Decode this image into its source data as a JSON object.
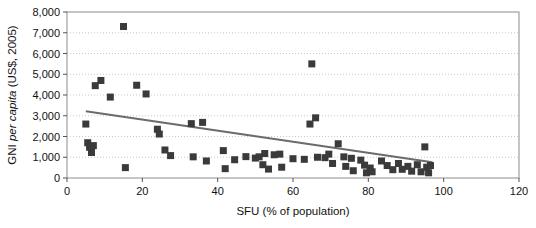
{
  "chart_data": {
    "type": "scatter",
    "title": "",
    "xlabel": "SFU (% of population)",
    "ylabel_prefix": "GNI ",
    "ylabel_italic": "per capita",
    "ylabel_suffix": " (US$, 2005)",
    "ylabel_full": "GNI per capita (US$, 2005)",
    "xlim": [
      0,
      120
    ],
    "ylim": [
      0,
      8000
    ],
    "xticks": [
      0,
      20,
      40,
      60,
      80,
      100,
      120
    ],
    "xtick_labels": [
      "0",
      "20",
      "40",
      "60",
      "80",
      "100",
      "120"
    ],
    "yticks": [
      0,
      1000,
      2000,
      3000,
      4000,
      5000,
      6000,
      7000,
      8000
    ],
    "ytick_labels": [
      "0",
      "1,000",
      "2,000",
      "3,000",
      "4,000",
      "5,000",
      "6,000",
      "7,000",
      "8,000"
    ],
    "grid": "horizontal-dotted",
    "legend": "none",
    "marker": {
      "shape": "square",
      "size": 7,
      "color": "#3a3a3a"
    },
    "trendline": {
      "color": "#6b6b6b",
      "width": 2,
      "x": [
        5,
        97
      ],
      "y": [
        3220,
        760
      ]
    },
    "points": [
      {
        "x": 5.0,
        "y": 2600
      },
      {
        "x": 5.5,
        "y": 1700
      },
      {
        "x": 6.0,
        "y": 1480
      },
      {
        "x": 6.5,
        "y": 1230
      },
      {
        "x": 7.0,
        "y": 1560
      },
      {
        "x": 7.5,
        "y": 4450
      },
      {
        "x": 9.0,
        "y": 4700
      },
      {
        "x": 11.5,
        "y": 3900
      },
      {
        "x": 15.0,
        "y": 7300
      },
      {
        "x": 15.5,
        "y": 500
      },
      {
        "x": 18.5,
        "y": 4470
      },
      {
        "x": 21.0,
        "y": 4050
      },
      {
        "x": 24.0,
        "y": 2350
      },
      {
        "x": 24.5,
        "y": 2120
      },
      {
        "x": 26.0,
        "y": 1350
      },
      {
        "x": 27.5,
        "y": 1080
      },
      {
        "x": 33.0,
        "y": 2620
      },
      {
        "x": 33.5,
        "y": 1020
      },
      {
        "x": 36.0,
        "y": 2680
      },
      {
        "x": 37.0,
        "y": 820
      },
      {
        "x": 41.5,
        "y": 1320
      },
      {
        "x": 42.0,
        "y": 450
      },
      {
        "x": 44.5,
        "y": 880
      },
      {
        "x": 47.5,
        "y": 1030
      },
      {
        "x": 50.0,
        "y": 960
      },
      {
        "x": 51.0,
        "y": 1020
      },
      {
        "x": 52.5,
        "y": 1180
      },
      {
        "x": 52.0,
        "y": 640
      },
      {
        "x": 53.5,
        "y": 430
      },
      {
        "x": 55.0,
        "y": 1120
      },
      {
        "x": 56.5,
        "y": 1150
      },
      {
        "x": 57.0,
        "y": 520
      },
      {
        "x": 60.0,
        "y": 930
      },
      {
        "x": 63.0,
        "y": 900
      },
      {
        "x": 64.5,
        "y": 2600
      },
      {
        "x": 65.0,
        "y": 5500
      },
      {
        "x": 66.0,
        "y": 2900
      },
      {
        "x": 66.5,
        "y": 1000
      },
      {
        "x": 68.5,
        "y": 980
      },
      {
        "x": 69.5,
        "y": 1150
      },
      {
        "x": 70.5,
        "y": 700
      },
      {
        "x": 72.0,
        "y": 1650
      },
      {
        "x": 73.5,
        "y": 1020
      },
      {
        "x": 74.0,
        "y": 560
      },
      {
        "x": 75.5,
        "y": 950
      },
      {
        "x": 76.0,
        "y": 350
      },
      {
        "x": 78.0,
        "y": 860
      },
      {
        "x": 79.0,
        "y": 620
      },
      {
        "x": 79.5,
        "y": 250
      },
      {
        "x": 80.5,
        "y": 480
      },
      {
        "x": 81.0,
        "y": 300
      },
      {
        "x": 83.5,
        "y": 820
      },
      {
        "x": 85.0,
        "y": 600
      },
      {
        "x": 86.5,
        "y": 400
      },
      {
        "x": 88.0,
        "y": 700
      },
      {
        "x": 89.0,
        "y": 420
      },
      {
        "x": 90.5,
        "y": 560
      },
      {
        "x": 91.5,
        "y": 330
      },
      {
        "x": 93.0,
        "y": 640
      },
      {
        "x": 94.0,
        "y": 300
      },
      {
        "x": 95.0,
        "y": 1500
      },
      {
        "x": 95.5,
        "y": 520
      },
      {
        "x": 96.0,
        "y": 250
      },
      {
        "x": 96.5,
        "y": 600
      }
    ]
  }
}
